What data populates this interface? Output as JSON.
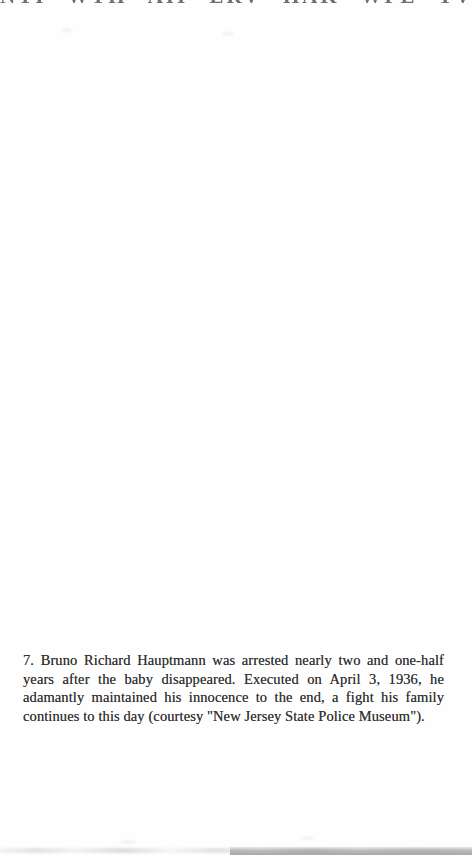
{
  "page": {
    "kind": "scanned book page",
    "background_color": "#fefefe"
  },
  "caption": {
    "figure_number": "7.",
    "text_color": "#333333",
    "full_text": "7. Bruno Richard Hauptmann was arrested nearly two and one-half years after the baby disappeared. Executed on April 3, 1936, he adamantly maintained his innocence to the end, a fight his family continues to this day (courtesy \"New Jersey State Police Museum\").",
    "lines": [
      "7. Bruno Richard Hauptmann was arrested nearly two and one-half",
      "years after the baby disappeared. Executed on April 3, 1936, he",
      "adamantly maintained his innocence to the end, a fight his family",
      "continues to this day (courtesy \"New Jersey State Police Museum\")."
    ]
  },
  "artifacts": {
    "top_edge_fragments_description": "illegible cut-off bottoms of a text line from the previous scanned page",
    "top_fragment_glyphs": "NTI WTH AII ERV HAK WFE TVH AEW NTL HMI ATE RWN KBT HEA VNM",
    "bottom_edge_description": "gray scanner edge smudge, darker bar on right half",
    "bottom_bar_color": "#6e6e6e"
  }
}
